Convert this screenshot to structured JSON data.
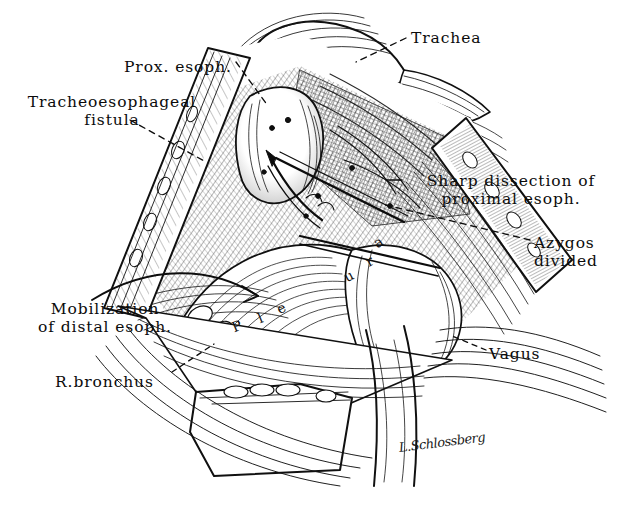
{
  "figure": {
    "background_color": "#ffffff",
    "ink_color": "#101010",
    "width": 618,
    "height": 505
  },
  "labels": [
    {
      "id": "trachea",
      "text": "Trachea",
      "x": 411,
      "y": 29,
      "align": "left",
      "leader": "dashed"
    },
    {
      "id": "prox-esoph",
      "text": "Prox. esoph.",
      "x": 124,
      "y": 58,
      "align": "left",
      "leader": "dashed"
    },
    {
      "id": "tracheoesophageal-fistula",
      "text": "Tracheoesophageal\nfistula",
      "x": 12,
      "y": 93,
      "align": "center",
      "leader": "dashed"
    },
    {
      "id": "sharp-dissection",
      "text": "Sharp dissection of\nproximal esoph.",
      "x": 404,
      "y": 172,
      "align": "center",
      "leader": "solid"
    },
    {
      "id": "azygos-divided",
      "text": "Azygos\ndivided",
      "x": 534,
      "y": 234,
      "align": "left",
      "leader": "dashed"
    },
    {
      "id": "mobilization-distal-esoph",
      "text": "Mobilization\nof distal esoph.",
      "x": 19,
      "y": 300,
      "align": "center",
      "leader": "arrow"
    },
    {
      "id": "vagus",
      "text": "Vagus",
      "x": 489,
      "y": 345,
      "align": "left",
      "leader": "dashed"
    },
    {
      "id": "r-bronchus",
      "text": "R.bronchus",
      "x": 55,
      "y": 373,
      "align": "left",
      "leader": "dashed"
    }
  ],
  "inner_labels": [
    {
      "id": "pleura-p",
      "text": "P",
      "x": 232,
      "y": 318,
      "rotate": -22
    },
    {
      "id": "pleura-l",
      "text": "l",
      "x": 258,
      "y": 310,
      "rotate": -22
    },
    {
      "id": "pleura-e",
      "text": "e",
      "x": 277,
      "y": 300,
      "rotate": -25
    },
    {
      "id": "pleura-u",
      "text": "u",
      "x": 344,
      "y": 268,
      "rotate": -28
    },
    {
      "id": "pleura-r",
      "text": "r",
      "x": 366,
      "y": 253,
      "rotate": -30
    },
    {
      "id": "pleura-a",
      "text": "a",
      "x": 374,
      "y": 234,
      "rotate": -32
    }
  ],
  "inner_label_word": "Pleura",
  "signature": {
    "id": "artist-signature",
    "text": "L.Schlossberg",
    "x": 398,
    "y": 440
  }
}
